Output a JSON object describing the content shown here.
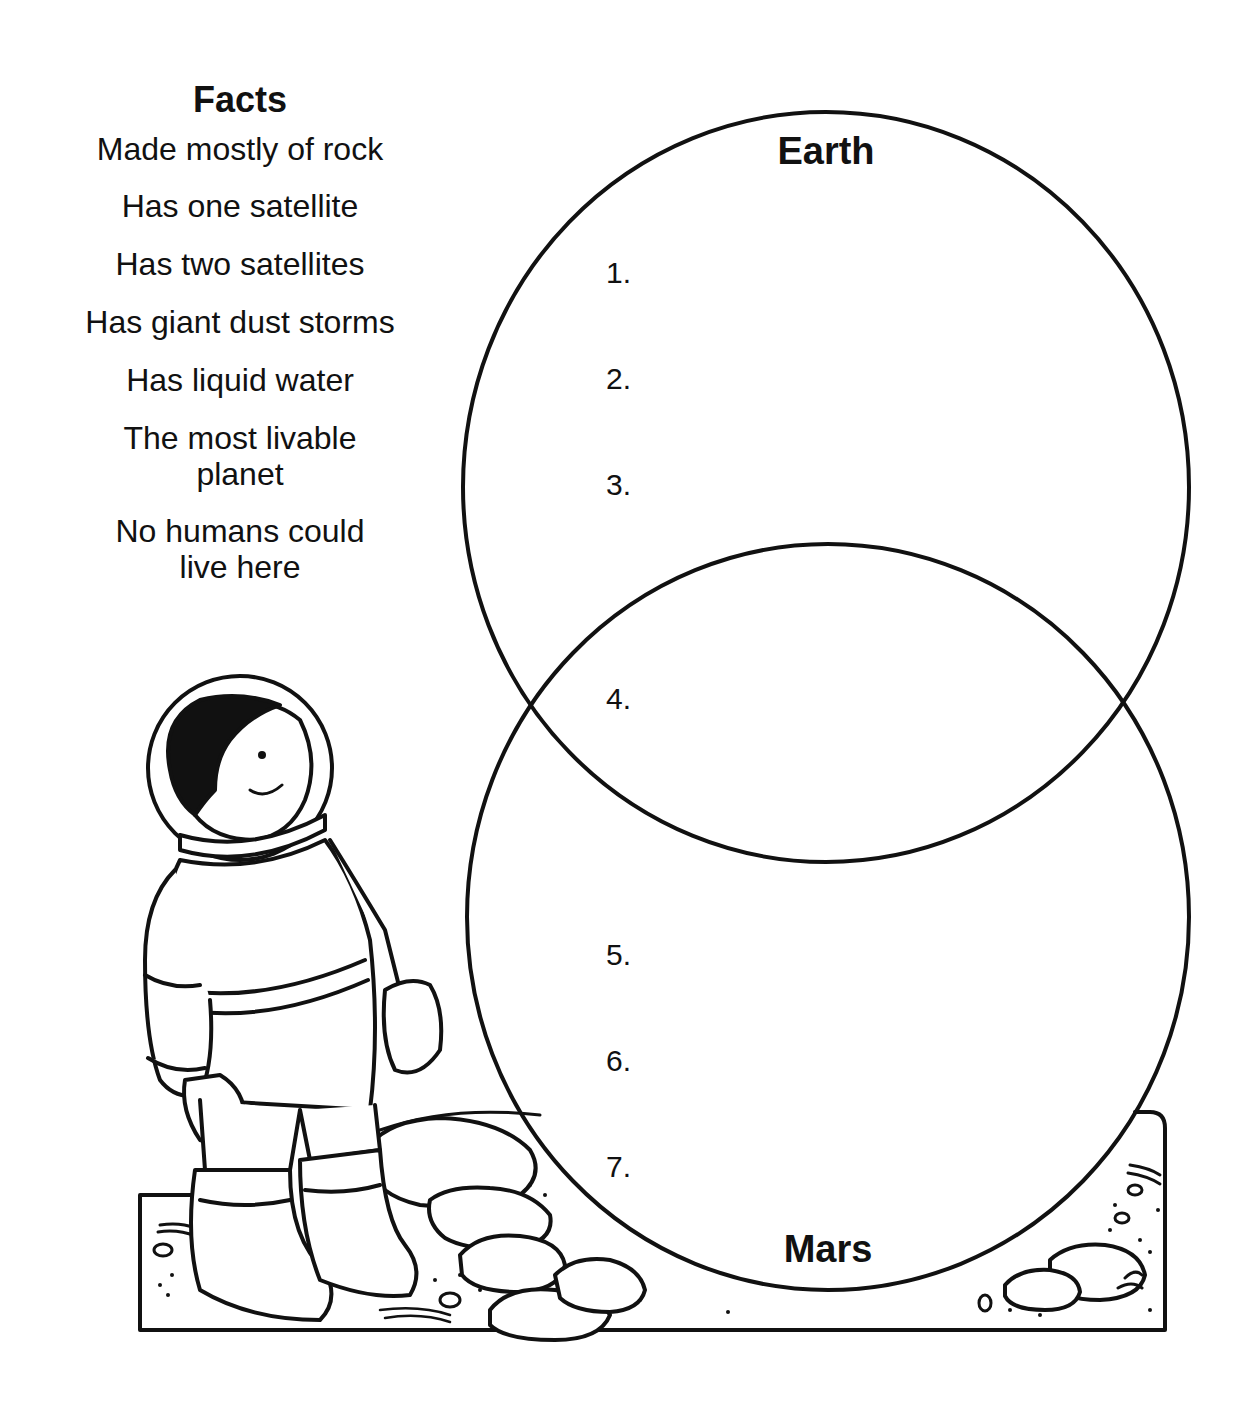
{
  "facts": {
    "title": "Facts",
    "items": [
      "Made mostly of rock",
      "Has one satellite",
      "Has two satellites",
      "Has giant dust storms",
      "Has liquid water",
      "The most livable planet",
      "No humans could live here"
    ],
    "items_lines": [
      [
        "Made mostly of rock"
      ],
      [
        "Has one satellite"
      ],
      [
        "Has two satellites"
      ],
      [
        "Has giant dust storms"
      ],
      [
        "Has liquid water"
      ],
      [
        "The most livable",
        "planet"
      ],
      [
        "No humans could",
        "live here"
      ]
    ]
  },
  "venn": {
    "top_circle_label": "Earth",
    "bottom_circle_label": "Mars",
    "slots": [
      "1.",
      "2.",
      "3.",
      "4.",
      "5.",
      "6.",
      "7."
    ]
  },
  "illustration": {
    "subject": "astronaut child standing on rocky Mars surface"
  },
  "colors": {
    "ink": "#111111",
    "paper": "#ffffff"
  }
}
